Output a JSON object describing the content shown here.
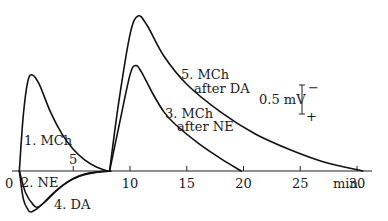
{
  "chart_data": {
    "type": "line",
    "title": "",
    "xlabel": "min.",
    "ylabel": "",
    "xlim": [
      0,
      31
    ],
    "x_ticks": [
      0,
      5,
      10,
      15,
      20,
      25,
      30
    ],
    "x_tick_labels": [
      "0",
      "5",
      "10",
      "15",
      "20",
      "25",
      "30"
    ],
    "x_unit_label": "min.",
    "grid": false,
    "scale_bar": {
      "label": "0.5 mV",
      "value_mV": 0.5,
      "top_sign": "−",
      "bottom_sign": "+"
    },
    "y_units": "mV (upward = negative)",
    "series": [
      {
        "name": "1. MCh",
        "label": "1. MCh",
        "x": [
          0.25,
          0.6,
          1.0,
          1.4,
          2.0,
          3.0,
          4.0,
          5.0,
          6.0,
          7.0,
          8.0
        ],
        "y": [
          0,
          0.9,
          1.45,
          1.55,
          1.4,
          0.95,
          0.6,
          0.35,
          0.18,
          0.07,
          0
        ]
      },
      {
        "name": "2. NE",
        "label": "2. NE",
        "x": [
          0.25,
          0.8,
          1.5,
          1.9,
          2.5,
          3.5,
          4.5,
          5.5,
          6.5,
          7.5,
          8.3
        ],
        "y": [
          0,
          -0.35,
          -0.55,
          -0.58,
          -0.5,
          -0.32,
          -0.18,
          -0.09,
          -0.04,
          -0.01,
          0
        ]
      },
      {
        "name": "3. MCh after NE",
        "label": "3. MCh after NE",
        "x": [
          8.2,
          9.0,
          10.0,
          10.5,
          11.0,
          12.0,
          13.0,
          14.0,
          16.0,
          18.0,
          19.8
        ],
        "y": [
          0,
          0.7,
          1.55,
          1.7,
          1.6,
          1.25,
          0.95,
          0.75,
          0.45,
          0.2,
          0
        ]
      },
      {
        "name": "4. DA",
        "label": "4. DA",
        "x": [
          0.25,
          0.6,
          1.0,
          1.3,
          2.0,
          3.0,
          4.0,
          5.0,
          6.0,
          7.0,
          8.3
        ],
        "y": [
          0,
          -0.45,
          -0.62,
          -0.66,
          -0.58,
          -0.4,
          -0.24,
          -0.12,
          -0.05,
          -0.02,
          0
        ]
      },
      {
        "name": "5. MCh after DA",
        "label": "5. MCh after DA",
        "x": [
          8.2,
          9.0,
          10.0,
          10.7,
          11.5,
          13.0,
          15.0,
          18.0,
          21.0,
          24.0,
          27.0,
          30.5
        ],
        "y": [
          0,
          1.1,
          2.2,
          2.5,
          2.35,
          1.85,
          1.4,
          0.95,
          0.6,
          0.35,
          0.15,
          0
        ]
      }
    ]
  },
  "labels": {
    "origin": "0",
    "curve1": "1. MCh",
    "curve2": "2. NE",
    "curve3_line1": "3. MCh",
    "curve3_line2": "after NE",
    "curve4": "4. DA",
    "curve5_line1": "5. MCh",
    "curve5_line2": "after DA",
    "scale": "0.5 mV",
    "scale_top": "−",
    "scale_bottom": "+",
    "unit": "min."
  }
}
